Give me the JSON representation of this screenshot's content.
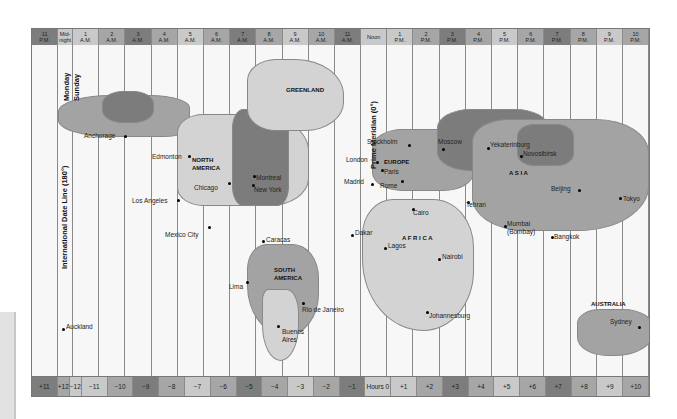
{
  "header": {
    "cells": [
      {
        "top": "11",
        "bottom": "P.M.",
        "shade": "s0"
      },
      {
        "top": "Mid-",
        "bottom": "night",
        "shade": "s2",
        "narrow": true
      },
      {
        "top": "1",
        "bottom": "A.M.",
        "shade": "s2"
      },
      {
        "top": "2",
        "bottom": "A.M.",
        "shade": "s1"
      },
      {
        "top": "3",
        "bottom": "A.M.",
        "shade": "s0"
      },
      {
        "top": "4",
        "bottom": "A.M.",
        "shade": "s1"
      },
      {
        "top": "5",
        "bottom": "A.M.",
        "shade": "s2"
      },
      {
        "top": "6",
        "bottom": "A.M.",
        "shade": "s1"
      },
      {
        "top": "7",
        "bottom": "A.M.",
        "shade": "s0"
      },
      {
        "top": "8",
        "bottom": "A.M.",
        "shade": "s1"
      },
      {
        "top": "9",
        "bottom": "A.M.",
        "shade": "s2"
      },
      {
        "top": "10",
        "bottom": "A.M.",
        "shade": "s1"
      },
      {
        "top": "11",
        "bottom": "A.M.",
        "shade": "s0"
      },
      {
        "top": "Noon",
        "bottom": "",
        "shade": "s2"
      },
      {
        "top": "1",
        "bottom": "P.M.",
        "shade": "s2"
      },
      {
        "top": "2",
        "bottom": "P.M.",
        "shade": "s1"
      },
      {
        "top": "3",
        "bottom": "P.M.",
        "shade": "s0"
      },
      {
        "top": "4",
        "bottom": "P.M.",
        "shade": "s1"
      },
      {
        "top": "5",
        "bottom": "P.M.",
        "shade": "s2"
      },
      {
        "top": "6",
        "bottom": "P.M.",
        "shade": "s1"
      },
      {
        "top": "7",
        "bottom": "P.M.",
        "shade": "s0"
      },
      {
        "top": "8",
        "bottom": "P.M.",
        "shade": "s1"
      },
      {
        "top": "9",
        "bottom": "P.M.",
        "shade": "s2"
      },
      {
        "top": "10",
        "bottom": "P.M.",
        "shade": "s1"
      }
    ]
  },
  "footer": {
    "cells": [
      {
        "label": "+11",
        "shade": "s0"
      },
      {
        "label": "+12",
        "shade": "s1",
        "narrow": true
      },
      {
        "label": "−12",
        "shade": "s2",
        "narrow": true
      },
      {
        "label": "−11",
        "shade": "s2"
      },
      {
        "label": "−10",
        "shade": "s1"
      },
      {
        "label": "−9",
        "shade": "s0"
      },
      {
        "label": "−8",
        "shade": "s1"
      },
      {
        "label": "−7",
        "shade": "s2"
      },
      {
        "label": "−6",
        "shade": "s1"
      },
      {
        "label": "−5",
        "shade": "s0"
      },
      {
        "label": "−4",
        "shade": "s1"
      },
      {
        "label": "−3",
        "shade": "s2"
      },
      {
        "label": "−2",
        "shade": "s1"
      },
      {
        "label": "−1",
        "shade": "s0"
      },
      {
        "label": "Hours 0",
        "shade": "s2"
      },
      {
        "label": "+1",
        "shade": "s2"
      },
      {
        "label": "+2",
        "shade": "s1"
      },
      {
        "label": "+3",
        "shade": "s0"
      },
      {
        "label": "+4",
        "shade": "s1"
      },
      {
        "label": "+5",
        "shade": "s2"
      },
      {
        "label": "+6",
        "shade": "s1"
      },
      {
        "label": "+7",
        "shade": "s0"
      },
      {
        "label": "+8",
        "shade": "s1"
      },
      {
        "label": "+9",
        "shade": "s2"
      },
      {
        "label": "+10",
        "shade": "s1"
      }
    ]
  },
  "annotations": {
    "monday": "Monday",
    "sunday": "Sunday",
    "date_line": "International Date Line (180°)",
    "prime_meridian": "Prime Meridian (0°)"
  },
  "regions": {
    "greenland": "GREENLAND",
    "north_america_1": "NORTH",
    "north_america_2": "AMERICA",
    "south_america_1": "SOUTH",
    "south_america_2": "AMERICA",
    "europe": "EUROPE",
    "africa": "A F R I C A",
    "asia": "A S I A",
    "australia": "AUSTRALIA"
  },
  "cities": {
    "anchorage": "Anchorage",
    "edmonton": "Edmonton",
    "chicago": "Chicago",
    "montreal": "Montreal",
    "new_york": "New York",
    "los_angeles": "Los Angeles",
    "mexico_city": "Mexico City",
    "caracas": "Caracas",
    "lima": "Lima",
    "rio": "Rio de Janeiro",
    "buenos_aires_1": "Buenos",
    "buenos_aires_2": "Aires",
    "auckland": "Auckland",
    "stockholm": "Stockholm",
    "london": "London",
    "paris": "Paris",
    "madrid": "Madrid",
    "rome": "Rome",
    "moscow": "Moscow",
    "cairo": "Cairo",
    "dakar": "Dakar",
    "lagos": "Lagos",
    "nairobi": "Nairobi",
    "johannesburg": "Johannesburg",
    "tehran": "Tehran",
    "yekaterinburg": "Yekaterinburg",
    "novosibirsk": "Novosibirsk",
    "mumbai_1": "Mumbai",
    "mumbai_2": "(Bombay)",
    "beijing": "Beijing",
    "bangkok": "Bangkok",
    "tokyo": "Tokyo",
    "sydney": "Sydney"
  }
}
